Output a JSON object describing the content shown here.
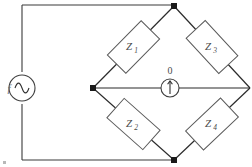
{
  "source": {
    "label": "f",
    "symbol": "ac-source-sine",
    "color": "#3f3f3f"
  },
  "detector": {
    "label": "0",
    "symbol": "null-detector-meter",
    "color": "#3f3f3f"
  },
  "impedances": [
    {
      "id": "z1",
      "base": "Z",
      "sub": "1",
      "label": "Z1",
      "arm": "upper-left"
    },
    {
      "id": "z3",
      "base": "Z",
      "sub": "3",
      "label": "Z3",
      "arm": "upper-right"
    },
    {
      "id": "z2",
      "base": "Z",
      "sub": "2",
      "label": "Z2",
      "arm": "lower-left"
    },
    {
      "id": "z4",
      "base": "Z",
      "sub": "4",
      "label": "Z4",
      "arm": "lower-right"
    }
  ],
  "nodes": [
    {
      "id": "top",
      "x": 174,
      "y": 6
    },
    {
      "id": "left",
      "x": 93,
      "y": 88
    },
    {
      "id": "right",
      "x": 250,
      "y": 88
    },
    {
      "id": "bottom",
      "x": 174,
      "y": 160
    }
  ],
  "colors": {
    "wire": "#3a3a3a",
    "box_stroke": "#5a5a5a",
    "node": "#1a1a1a",
    "text": "#4a4a4a",
    "background": "#ffffff"
  }
}
